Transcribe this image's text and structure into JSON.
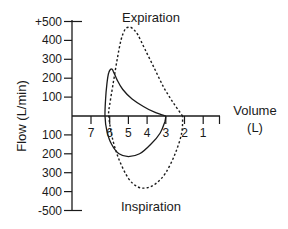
{
  "chart_data": {
    "type": "line",
    "title_top": "Expiration",
    "title_bottom": "Inspiration",
    "xlabel": "Volume",
    "xlabel_unit": "(L)",
    "ylabel": "Flow (L/min)",
    "x_ticks": [
      "7",
      "6",
      "5",
      "4",
      "3",
      "2",
      "1"
    ],
    "x_tick_values": [
      7,
      6,
      5,
      4,
      3,
      2,
      1
    ],
    "x_axis_reversed": true,
    "y_ticks_upper": [
      "+500",
      "400",
      "300",
      "200",
      "100"
    ],
    "y_ticks_upper_values": [
      500,
      400,
      300,
      200,
      100
    ],
    "y_ticks_lower": [
      "100",
      "200",
      "300",
      "400",
      "-500"
    ],
    "y_ticks_lower_values": [
      -100,
      -200,
      -300,
      -400,
      -500
    ],
    "ylim": [
      -500,
      500
    ],
    "xlim": [
      7.5,
      0.5
    ],
    "series": [
      {
        "name": "solid-loop",
        "style": "solid",
        "points": [
          [
            3.0,
            0
          ],
          [
            3.6,
            20
          ],
          [
            4.2,
            50
          ],
          [
            4.8,
            90
          ],
          [
            5.3,
            140
          ],
          [
            5.6,
            190
          ],
          [
            5.8,
            235
          ],
          [
            5.9,
            250
          ],
          [
            6.05,
            230
          ],
          [
            6.15,
            170
          ],
          [
            6.22,
            90
          ],
          [
            6.25,
            0
          ],
          [
            6.15,
            -80
          ],
          [
            5.9,
            -150
          ],
          [
            5.5,
            -200
          ],
          [
            5.0,
            -215
          ],
          [
            4.4,
            -200
          ],
          [
            3.8,
            -150
          ],
          [
            3.3,
            -90
          ],
          [
            3.05,
            -30
          ],
          [
            3.0,
            0
          ]
        ]
      },
      {
        "name": "dashed-loop",
        "style": "dashed",
        "points": [
          [
            2.1,
            0
          ],
          [
            2.6,
            70
          ],
          [
            3.1,
            150
          ],
          [
            3.6,
            250
          ],
          [
            4.1,
            350
          ],
          [
            4.5,
            430
          ],
          [
            4.8,
            465
          ],
          [
            5.0,
            470
          ],
          [
            5.2,
            455
          ],
          [
            5.4,
            400
          ],
          [
            5.6,
            300
          ],
          [
            5.8,
            180
          ],
          [
            6.0,
            60
          ],
          [
            6.05,
            0
          ],
          [
            5.85,
            -120
          ],
          [
            5.5,
            -230
          ],
          [
            5.0,
            -330
          ],
          [
            4.5,
            -375
          ],
          [
            4.0,
            -380
          ],
          [
            3.5,
            -355
          ],
          [
            3.0,
            -300
          ],
          [
            2.5,
            -200
          ],
          [
            2.15,
            -90
          ],
          [
            2.1,
            0
          ]
        ]
      }
    ]
  }
}
